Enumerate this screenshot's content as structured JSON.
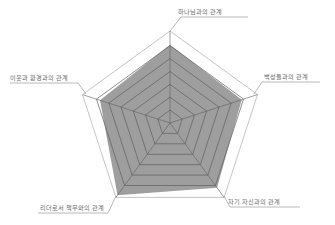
{
  "chart_data": {
    "type": "radar",
    "title": "",
    "axes": [
      "하나님과의 관계",
      "백성들과의 관계",
      "자기 자신과의 관계",
      "리더로서 책무와의 관계",
      "이웃과 환경과의 관계"
    ],
    "series": [
      {
        "name": "score",
        "values": [
          0.85,
          0.82,
          0.87,
          0.97,
          0.8
        ]
      }
    ],
    "range": [
      0,
      1
    ],
    "grid_levels": 7,
    "grid": true,
    "legend": "none",
    "colors": {
      "fill": "#9e9e9e",
      "grid": "#5f5f5f",
      "outer": "#b5b5b5",
      "leader": "#8a8a8a",
      "label": "#6b6b6b"
    }
  }
}
